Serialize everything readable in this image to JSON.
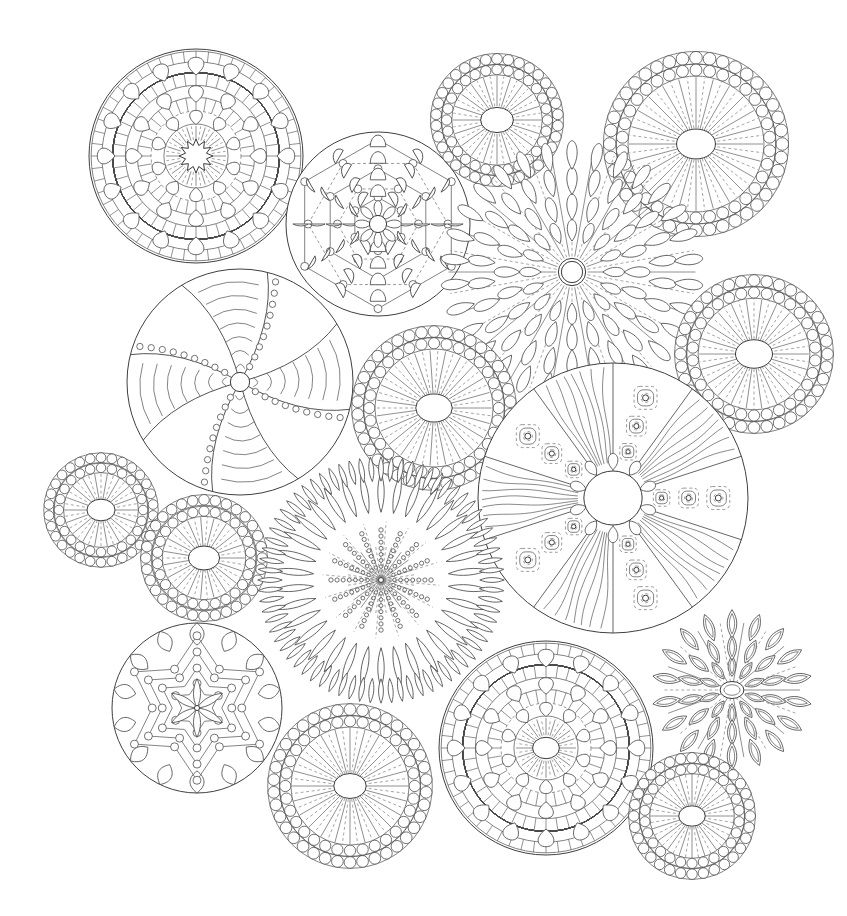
{
  "page": {
    "width": 847,
    "height": 916,
    "background_color": "#ffffff",
    "line_color": "#4a4a4a",
    "faint_line_color": "#6e6e6e",
    "style": "black-and-white line art, coloring book page"
  },
  "mandalas": [
    {
      "id": "m-top-left-ornate",
      "name": "ornate-ring-mandala-top-left",
      "cx": 196,
      "cy": 156,
      "r": 107,
      "rotation": 0,
      "style": "ornate",
      "spokes": 16,
      "bead_rings": [],
      "rings": [
        0.98,
        0.88,
        0.78,
        0.66,
        0.55,
        0.42,
        0.3
      ],
      "petal_rings": [
        {
          "radius": 0.84,
          "count": 16,
          "len": 0.15,
          "wid": 0.075
        },
        {
          "radius": 0.58,
          "count": 12,
          "len": 0.14,
          "wid": 0.07
        },
        {
          "radius": 0.36,
          "count": 10,
          "len": 0.12,
          "wid": 0.06
        }
      ],
      "hatch_rings": [
        {
          "r0": 0.88,
          "r1": 0.98,
          "count": 52
        },
        {
          "r0": 0.66,
          "r1": 0.78,
          "count": 44
        },
        {
          "r0": 0.42,
          "r1": 0.55,
          "count": 36
        }
      ],
      "core_radius": 0.13,
      "core_shape": "scallop",
      "core_points": 12
    },
    {
      "id": "m-top-center-dashed",
      "name": "dashed-hex-layer-mandala-top-center",
      "cx": 378,
      "cy": 224,
      "r": 92,
      "rotation": 0,
      "style": "hexlayer",
      "spokes": 12,
      "layers": [
        0.92,
        0.76,
        0.6,
        0.44,
        0.29
      ],
      "vertex_dot_radius": 4,
      "hex_sides": 6,
      "fan_count": 12,
      "core_radius": 0.15
    },
    {
      "id": "m-top-beaded-small",
      "name": "beaded-ray-circle-top-center-right",
      "cx": 497,
      "cy": 120,
      "r": 63,
      "rotation": 0,
      "style": "beaded",
      "bead_rings": [
        {
          "radius": 0.97,
          "count": 34,
          "bead_r": 0.085
        },
        {
          "radius": 0.8,
          "count": 28,
          "bead_r": 0.082
        }
      ],
      "ray_count": 40,
      "ray_inner": 0.22,
      "ray_outer": 0.7,
      "core_radius": 0.2
    },
    {
      "id": "m-top-right-beaded",
      "name": "beaded-ray-circle-top-right",
      "cx": 696,
      "cy": 144,
      "r": 88,
      "rotation": 0,
      "style": "beaded",
      "bead_rings": [
        {
          "radius": 0.98,
          "count": 40,
          "bead_r": 0.072
        },
        {
          "radius": 0.84,
          "count": 34,
          "bead_r": 0.068
        }
      ],
      "ray_count": 48,
      "ray_inner": 0.18,
      "ray_outer": 0.76,
      "core_radius": 0.17
    },
    {
      "id": "m-sunflower-center",
      "name": "sunflower-petal-mandala-center",
      "cx": 572,
      "cy": 272,
      "r": 130,
      "rotation": 0,
      "style": "sunflower",
      "petal_rings": [
        {
          "radius": 0.9,
          "count": 30,
          "len": 0.2,
          "wid": 0.055
        },
        {
          "radius": 0.7,
          "count": 26,
          "len": 0.19,
          "wid": 0.055
        },
        {
          "radius": 0.5,
          "count": 20,
          "len": 0.18,
          "wid": 0.055
        },
        {
          "radius": 0.32,
          "count": 16,
          "len": 0.15,
          "wid": 0.05
        }
      ],
      "ray_count": 36,
      "ray_inner": 0.12,
      "ray_outer": 0.95,
      "core_radius": 0.105,
      "core_double": true
    },
    {
      "id": "m-left-pinwheel",
      "name": "pinwheel-striped-mandala-left",
      "cx": 240,
      "cy": 382,
      "r": 113,
      "rotation": 14,
      "style": "pinwheel",
      "blades": 8,
      "band_dot_count": 9,
      "chevron_count": 7,
      "core_radius": 0.085
    },
    {
      "id": "m-center-beaded-med",
      "name": "beaded-ray-circle-center",
      "cx": 434,
      "cy": 408,
      "r": 78,
      "rotation": 0,
      "style": "beaded",
      "bead_rings": [
        {
          "radius": 0.98,
          "count": 38,
          "bead_r": 0.075
        },
        {
          "radius": 0.83,
          "count": 32,
          "bead_r": 0.072
        }
      ],
      "ray_count": 46,
      "ray_inner": 0.19,
      "ray_outer": 0.74,
      "core_radius": 0.18
    },
    {
      "id": "m-right-beaded-med",
      "name": "beaded-ray-circle-right",
      "cx": 754,
      "cy": 354,
      "r": 75,
      "rotation": 0,
      "style": "beaded",
      "bead_rings": [
        {
          "radius": 0.98,
          "count": 36,
          "bead_r": 0.078
        },
        {
          "radius": 0.82,
          "count": 30,
          "bead_r": 0.075
        }
      ],
      "ray_count": 44,
      "ray_inner": 0.2,
      "ray_outer": 0.73,
      "core_radius": 0.19
    },
    {
      "id": "m-big-wedge-right",
      "name": "wedge-sector-mandala-right",
      "cx": 613,
      "cy": 498,
      "r": 135,
      "rotation": 0,
      "style": "wedge",
      "sectors": 10,
      "motif_ring_radii": [
        0.78,
        0.56,
        0.36
      ],
      "core_radius": 0.2,
      "core_petal_count": 10,
      "wave_lines": 7
    },
    {
      "id": "m-left-beaded-small",
      "name": "beaded-ray-circle-far-left",
      "cx": 101,
      "cy": 510,
      "r": 54,
      "rotation": 0,
      "style": "beaded",
      "bead_rings": [
        {
          "radius": 0.97,
          "count": 30,
          "bead_r": 0.09
        },
        {
          "radius": 0.78,
          "count": 24,
          "bead_r": 0.088
        }
      ],
      "ray_count": 36,
      "ray_inner": 0.2,
      "ray_outer": 0.68,
      "core_radius": 0.2
    },
    {
      "id": "m-left-beaded-small2",
      "name": "beaded-ray-circle-left-lower",
      "cx": 204,
      "cy": 558,
      "r": 60,
      "rotation": 0,
      "style": "beaded",
      "bead_rings": [
        {
          "radius": 0.97,
          "count": 32,
          "bead_r": 0.088
        },
        {
          "radius": 0.78,
          "count": 26,
          "bead_r": 0.085
        }
      ],
      "ray_count": 38,
      "ray_inner": 0.2,
      "ray_outer": 0.68,
      "core_radius": 0.2
    },
    {
      "id": "m-spiky-urchin",
      "name": "spiky-urchin-mandala-center-bottom",
      "cx": 381,
      "cy": 580,
      "r": 122,
      "rotation": 0,
      "style": "urchin",
      "spike_ring": {
        "radius": 0.97,
        "count": 72,
        "len": 0.16,
        "wid": 0.012
      },
      "petal_rings": [
        {
          "radius": 0.72,
          "count": 34,
          "len": 0.3,
          "wid": 0.035
        }
      ],
      "dot_ray_count": 16,
      "dots_per_ray": 7,
      "ray_count": 40,
      "ray_inner": 0.02,
      "ray_outer": 0.28,
      "core_radius": 0.02
    },
    {
      "id": "m-bottom-left-flower",
      "name": "six-point-star-flower-bottom-left",
      "cx": 197,
      "cy": 708,
      "r": 85,
      "rotation": 0,
      "style": "starflower",
      "star_layers": [
        0.85,
        0.66,
        0.47,
        0.29
      ],
      "star_points": 6,
      "vertex_dot_radius": 4,
      "scallop_count": 14,
      "core_radius": 0.03
    },
    {
      "id": "m-bottom-center-beaded",
      "name": "beaded-ray-circle-bottom-center",
      "cx": 350,
      "cy": 786,
      "r": 78,
      "rotation": 0,
      "style": "beaded",
      "bead_rings": [
        {
          "radius": 0.98,
          "count": 38,
          "bead_r": 0.075
        },
        {
          "radius": 0.83,
          "count": 32,
          "bead_r": 0.072
        }
      ],
      "ray_count": 48,
      "ray_inner": 0.17,
      "ray_outer": 0.75,
      "core_radius": 0.16
    },
    {
      "id": "m-bottom-right-ornate",
      "name": "ornate-ring-mandala-bottom-right",
      "cx": 546,
      "cy": 748,
      "r": 107,
      "rotation": 0,
      "style": "ornate",
      "spokes": 16,
      "rings": [
        0.98,
        0.88,
        0.78,
        0.66,
        0.55,
        0.42,
        0.3
      ],
      "petal_rings": [
        {
          "radius": 0.84,
          "count": 16,
          "len": 0.15,
          "wid": 0.075
        },
        {
          "radius": 0.58,
          "count": 12,
          "len": 0.14,
          "wid": 0.07
        },
        {
          "radius": 0.36,
          "count": 10,
          "len": 0.12,
          "wid": 0.06
        }
      ],
      "hatch_rings": [
        {
          "r0": 0.88,
          "r1": 0.98,
          "count": 52
        },
        {
          "r0": 0.66,
          "r1": 0.78,
          "count": 44
        },
        {
          "r0": 0.42,
          "r1": 0.55,
          "count": 36
        }
      ],
      "core_radius": 0.1,
      "core_shape": "ellipse",
      "core_points": 12
    },
    {
      "id": "m-bottom-right-leafflower",
      "name": "leaf-petal-flower-bottom-right",
      "cx": 732,
      "cy": 690,
      "r": 85,
      "rotation": 0,
      "style": "leafflower",
      "petal_rings": [
        {
          "radius": 0.78,
          "count": 18,
          "len": 0.3,
          "wid": 0.075
        },
        {
          "radius": 0.5,
          "count": 14,
          "len": 0.27,
          "wid": 0.07
        },
        {
          "radius": 0.28,
          "count": 10,
          "len": 0.22,
          "wid": 0.06
        }
      ],
      "ray_count": 18,
      "ray_inner": 0.1,
      "ray_outer": 0.8,
      "core_radius": 0.1
    },
    {
      "id": "m-bottom-right-beaded-small",
      "name": "beaded-ray-circle-bottom-right",
      "cx": 692,
      "cy": 816,
      "r": 60,
      "rotation": 0,
      "style": "beaded",
      "bead_rings": [
        {
          "radius": 0.97,
          "count": 32,
          "bead_r": 0.088
        },
        {
          "radius": 0.79,
          "count": 26,
          "bead_r": 0.085
        }
      ],
      "ray_count": 40,
      "ray_inner": 0.18,
      "ray_outer": 0.7,
      "core_radius": 0.17
    }
  ]
}
